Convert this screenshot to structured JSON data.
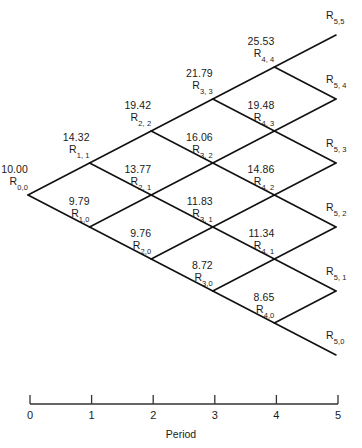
{
  "figure": {
    "type": "binomial-lattice",
    "title": "",
    "axis": {
      "label": "Period",
      "ticks": [
        "0",
        "1",
        "2",
        "3",
        "4",
        "5"
      ],
      "x_start_px": 30,
      "x_end_px": 338,
      "y_px": 404
    },
    "geometry": {
      "origin_x": 28,
      "origin_y": 195,
      "dx": 61.6,
      "dy": 32
    },
    "line_color": "#111111"
  },
  "chart_data": {
    "type": "lattice",
    "title": "",
    "xlabel": "Period",
    "ylabel": "",
    "xticks": [
      "0",
      "1",
      "2",
      "3",
      "4",
      "5"
    ],
    "periods": [
      0,
      1,
      2,
      3,
      4,
      5
    ],
    "nodes": [
      {
        "i": 0,
        "j": 0,
        "value": "10.00",
        "id": "R",
        "sub": "0,0"
      },
      {
        "i": 1,
        "j": 1,
        "value": "14.32",
        "id": "R",
        "sub": "1, 1"
      },
      {
        "i": 1,
        "j": 0,
        "value": "9.79",
        "id": "R",
        "sub": "1,0"
      },
      {
        "i": 2,
        "j": 2,
        "value": "19.42",
        "id": "R",
        "sub": "2, 2"
      },
      {
        "i": 2,
        "j": 1,
        "value": "13.77",
        "id": "R",
        "sub": "2, 1"
      },
      {
        "i": 2,
        "j": 0,
        "value": "9.76",
        "id": "R",
        "sub": "2,0"
      },
      {
        "i": 3,
        "j": 3,
        "value": "21.79",
        "id": "R",
        "sub": "3, 3"
      },
      {
        "i": 3,
        "j": 2,
        "value": "16.06",
        "id": "R",
        "sub": "3, 2"
      },
      {
        "i": 3,
        "j": 1,
        "value": "11.83",
        "id": "R",
        "sub": "3, 1"
      },
      {
        "i": 3,
        "j": 0,
        "value": "8.72",
        "id": "R",
        "sub": "3,0"
      },
      {
        "i": 4,
        "j": 4,
        "value": "25.53",
        "id": "R",
        "sub": "4, 4"
      },
      {
        "i": 4,
        "j": 3,
        "value": "19.48",
        "id": "R",
        "sub": "4, 3"
      },
      {
        "i": 4,
        "j": 2,
        "value": "14.86",
        "id": "R",
        "sub": "4, 2"
      },
      {
        "i": 4,
        "j": 1,
        "value": "11.34",
        "id": "R",
        "sub": "4, 1"
      },
      {
        "i": 4,
        "j": 0,
        "value": "8.65",
        "id": "R",
        "sub": "4,0"
      }
    ],
    "terminal_nodes": [
      {
        "i": 5,
        "j": 5,
        "label": "R5,5"
      },
      {
        "i": 5,
        "j": 4,
        "label": "R5, 4"
      },
      {
        "i": 5,
        "j": 3,
        "label": "R5, 3"
      },
      {
        "i": 5,
        "j": 2,
        "label": "R5, 2"
      },
      {
        "i": 5,
        "j": 1,
        "label": "R5, 1"
      },
      {
        "i": 5,
        "j": 0,
        "label": "R5,0"
      }
    ]
  }
}
